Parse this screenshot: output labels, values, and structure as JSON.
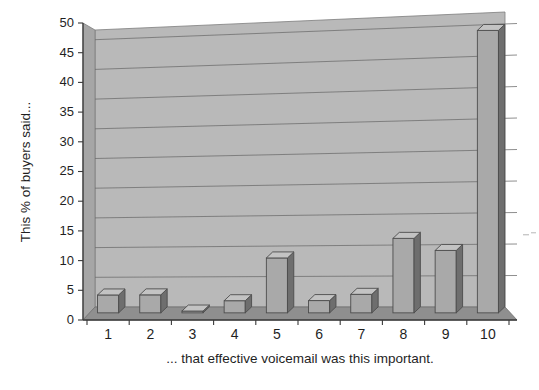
{
  "chart_data": {
    "type": "bar",
    "title": "",
    "subtitle": "",
    "xlabel": "... that effective voicemail was this important.",
    "ylabel": "This % of buyers said...",
    "categories": [
      "1",
      "2",
      "3",
      "4",
      "5",
      "6",
      "7",
      "8",
      "9",
      "10"
    ],
    "values": [
      3,
      3,
      0.3,
      2,
      9,
      2,
      3,
      12,
      10,
      45
    ],
    "series": [
      {
        "name": "Percent of buyers",
        "values": [
          3,
          3,
          0.3,
          2,
          9,
          2,
          3,
          12,
          10,
          45
        ]
      }
    ],
    "ylim": [
      0,
      50
    ],
    "ytick_step": 5,
    "yticks": [
      "0",
      "5",
      "10",
      "15",
      "20",
      "25",
      "30",
      "35",
      "40",
      "45",
      "50"
    ],
    "xlim_categories": 10,
    "grid": true,
    "grid_axis": "y",
    "legend": false,
    "legend_position": "none",
    "three_d": true,
    "colors": {
      "bar_face": "#a9a9a9",
      "bar_side": "#6e6e6e",
      "bar_top": "#c3c3c3",
      "bar_outline": "#4d4d4d",
      "plot_back_wall": "#b9b9b9",
      "plot_left_wall": "#acacac",
      "plot_floor": "#8f8f8f",
      "gridline": "#6d6d6d",
      "axis_line": "#3a3a3a",
      "text": "#1f1f1f",
      "page_background": "#ffffff"
    }
  },
  "axes": {
    "y_axis_label": "This % of buyers said...",
    "x_axis_label": "... that effective voicemail was this important.",
    "y_ticks": [
      "50",
      "45",
      "40",
      "35",
      "30",
      "25",
      "20",
      "15",
      "10",
      "5",
      "0"
    ],
    "x_ticks": [
      "1",
      "2",
      "3",
      "4",
      "5",
      "6",
      "7",
      "8",
      "9",
      "10"
    ]
  }
}
